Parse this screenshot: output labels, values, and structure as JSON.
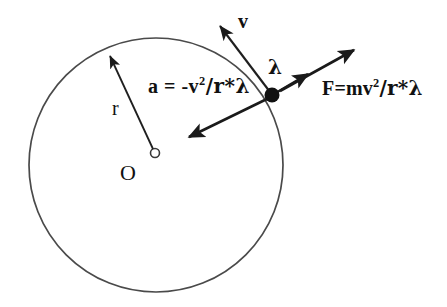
{
  "figure": {
    "background_color": "#ffffff",
    "stroke_color": "#222222",
    "labels": {
      "center": "O",
      "radius": "r",
      "velocity": "v",
      "unit_vector": "λ",
      "acceleration_prefix": "a = -v",
      "acceleration_exponent": "2",
      "acceleration_suffix": "/r*λ",
      "acceleration_full": "a = -v2/r*λ",
      "force_prefix": "F=mv",
      "force_exponent": "2",
      "force_suffix": "/r*λ",
      "force_full": "F=mv2/r*λ"
    },
    "geometry": {
      "circle_center_x": 156,
      "circle_center_y": 165,
      "circle_radius": 127,
      "center_dot_radius": 4,
      "particle_x": 272,
      "particle_y": 95,
      "particle_dot_radius": 7
    },
    "vectors": [
      {
        "name": "radius",
        "label": "r",
        "from_x": 155,
        "from_y": 150,
        "to_x": 107,
        "to_y": 50,
        "head": "end"
      },
      {
        "name": "velocity",
        "label": "v",
        "from_x": 270,
        "from_y": 92,
        "to_x": 217,
        "to_y": 21,
        "head": "end"
      },
      {
        "name": "acceleration",
        "label": "a = -v2/r*λ",
        "from_x": 272,
        "from_y": 97,
        "to_x": 183,
        "to_y": 140,
        "head": "end"
      },
      {
        "name": "unit-vector-lambda",
        "label": "λ",
        "from_x": 274,
        "from_y": 94,
        "to_x": 312,
        "to_y": 72,
        "head": "end"
      },
      {
        "name": "force",
        "label": "F=mv2/r*λ",
        "from_x": 274,
        "from_y": 94,
        "to_x": 359,
        "to_y": 47,
        "head": "end"
      }
    ]
  }
}
